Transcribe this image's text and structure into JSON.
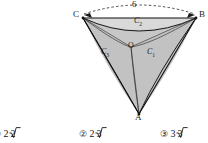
{
  "figure": {
    "name": "curvilinear-triangle-diagram",
    "vertices": [
      {
        "id": "C",
        "label": "C",
        "x": 80,
        "y": 16
      },
      {
        "id": "B",
        "label": "B",
        "x": 198,
        "y": 16
      },
      {
        "id": "A",
        "label": "A",
        "x": 139,
        "y": 116
      }
    ],
    "center": {
      "id": "O",
      "label": "O",
      "x": 131,
      "y": 47
    },
    "arcs": [
      {
        "id": "C1",
        "label": "C",
        "sub": "1",
        "x": 150,
        "y": 53
      },
      {
        "id": "C2",
        "label": "C",
        "sub": "2",
        "x": 137,
        "y": 21
      },
      {
        "id": "C3",
        "label": "C",
        "sub": "3",
        "x": 105,
        "y": 53
      }
    ],
    "dimension": {
      "label": "6",
      "x": 134,
      "y": 3
    },
    "colors": {
      "stroke": "#1a1a1a",
      "shade": "#b9b9b9",
      "shade_light": "#cfcfcf",
      "dashed": "#3a3a3a"
    }
  },
  "options": [
    {
      "num": "①",
      "value": "2",
      "radicand": "2",
      "x": 2
    },
    {
      "num": "②",
      "value": "2",
      "radicand": "3",
      "x": 82
    },
    {
      "num": "③",
      "value": "3",
      "radicand": "3",
      "x": 163
    }
  ]
}
